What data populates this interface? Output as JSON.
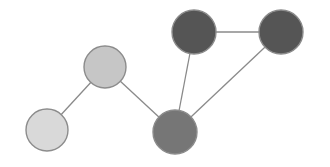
{
  "diagram": {
    "type": "undirected-graph",
    "background": "#ffffff",
    "edge_color": "#8a8a8a",
    "nodes": [
      {
        "id": "n1",
        "x": 47,
        "y": 130,
        "r": 21,
        "fill": "#d9d9d9"
      },
      {
        "id": "n2",
        "x": 105,
        "y": 67,
        "r": 21,
        "fill": "#c6c6c6"
      },
      {
        "id": "n3",
        "x": 175,
        "y": 132,
        "r": 22,
        "fill": "#767676"
      },
      {
        "id": "n4",
        "x": 194,
        "y": 32,
        "r": 22,
        "fill": "#555555"
      },
      {
        "id": "n5",
        "x": 281,
        "y": 32,
        "r": 22,
        "fill": "#555555"
      }
    ],
    "edges": [
      {
        "from": "n1",
        "to": "n2"
      },
      {
        "from": "n2",
        "to": "n3"
      },
      {
        "from": "n3",
        "to": "n4"
      },
      {
        "from": "n4",
        "to": "n5"
      },
      {
        "from": "n3",
        "to": "n5"
      }
    ]
  }
}
